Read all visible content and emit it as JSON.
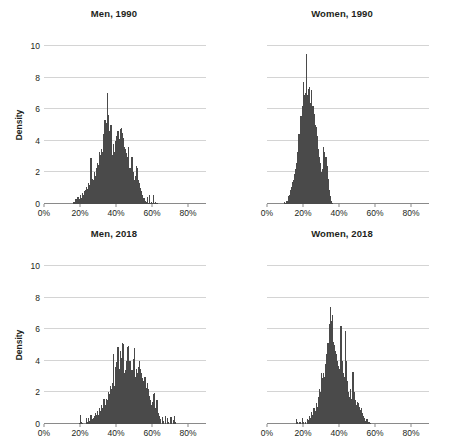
{
  "figure": {
    "cropped_header_text": "",
    "axis_color": "#8a8a8a",
    "grid_color": "#d4d4d4",
    "bar_color": "#4a4a4a",
    "text_color": "#231f20"
  },
  "chart_data": [
    {
      "type": "bar",
      "title": "Men, 1990",
      "xlabel": "",
      "ylabel": "Density",
      "xlim": [
        0,
        90
      ],
      "ylim": [
        0,
        10
      ],
      "xticks": [
        0,
        20,
        40,
        60,
        80
      ],
      "xtick_labels": [
        "0%",
        "20%",
        "40%",
        "60%",
        "80%"
      ],
      "yticks": [
        0,
        2,
        4,
        6,
        8,
        10
      ],
      "ytick_labels": [
        "0",
        "2",
        "4",
        "6",
        "8",
        "10"
      ],
      "grid": "horizontal",
      "legend": "none",
      "bin_width": 0.6,
      "x": [
        16.2,
        16.8,
        17.4,
        18.0,
        18.6,
        19.2,
        19.8,
        20.4,
        21.0,
        21.6,
        22.2,
        22.8,
        23.4,
        24.0,
        24.6,
        25.2,
        25.8,
        26.4,
        27.0,
        27.6,
        28.2,
        28.8,
        29.4,
        30.0,
        30.6,
        31.2,
        31.8,
        32.4,
        33.0,
        33.6,
        34.2,
        34.8,
        35.4,
        36.0,
        36.6,
        37.2,
        37.8,
        38.4,
        39.0,
        39.6,
        40.2,
        40.8,
        41.4,
        42.0,
        42.6,
        43.2,
        43.8,
        44.4,
        45.0,
        45.6,
        46.2,
        46.8,
        47.4,
        48.0,
        48.6,
        49.2,
        49.8,
        50.4,
        51.0,
        51.6,
        52.2,
        52.8,
        53.4,
        54.0,
        54.6,
        55.2,
        55.8,
        56.4,
        57.0,
        57.6,
        58.2,
        58.8,
        59.4,
        60.0,
        60.6,
        61.2,
        61.8,
        62.4
      ],
      "values": [
        0.15,
        0.1,
        0.3,
        0.2,
        0.45,
        0.3,
        0.6,
        0.4,
        0.7,
        0.55,
        0.8,
        0.9,
        1.1,
        0.95,
        1.35,
        1.2,
        2.9,
        1.6,
        1.5,
        2.0,
        1.8,
        2.3,
        2.6,
        2.5,
        3.3,
        3.1,
        3.5,
        3.3,
        4.4,
        5.3,
        5.1,
        7.0,
        5.65,
        4.6,
        5.0,
        5.0,
        3.1,
        3.8,
        3.3,
        4.0,
        4.3,
        4.6,
        4.1,
        4.75,
        4.8,
        4.5,
        4.2,
        3.6,
        3.5,
        3.2,
        3.0,
        3.6,
        2.3,
        2.05,
        3.0,
        2.05,
        1.55,
        1.75,
        2.4,
        2.3,
        1.5,
        1.3,
        1.0,
        0.8,
        0.6,
        0.35,
        0.2,
        0.1,
        0.45,
        0.05,
        0.6,
        0.05,
        0.15,
        0.05,
        0.55,
        0.05,
        0.1,
        0.05
      ]
    },
    {
      "type": "bar",
      "title": "Women, 1990",
      "xlabel": "",
      "ylabel": "",
      "xlim": [
        0,
        90
      ],
      "ylim": [
        0,
        10
      ],
      "xticks": [
        0,
        20,
        40,
        60,
        80
      ],
      "xtick_labels": [
        "0%",
        "20%",
        "40%",
        "60%",
        "80%"
      ],
      "yticks": [
        0,
        2,
        4,
        6,
        8,
        10
      ],
      "ytick_labels": [
        "",
        "",
        "",
        "",
        "",
        ""
      ],
      "grid": "horizontal",
      "legend": "none",
      "bin_width": 0.6,
      "x": [
        9.6,
        10.2,
        10.8,
        11.4,
        12.0,
        12.6,
        13.2,
        13.8,
        14.4,
        15.0,
        15.6,
        16.2,
        16.8,
        17.4,
        18.0,
        18.6,
        19.2,
        19.8,
        20.4,
        21.0,
        21.6,
        22.2,
        22.8,
        23.4,
        24.0,
        24.6,
        25.2,
        25.8,
        26.4,
        27.0,
        27.6,
        28.2,
        28.8,
        29.4,
        30.0,
        30.6,
        31.2,
        31.8,
        32.4,
        33.0,
        33.6,
        34.2,
        34.8,
        35.4,
        36.0
      ],
      "values": [
        0.15,
        0.05,
        0.2,
        0.5,
        0.6,
        0.9,
        1.1,
        1.4,
        1.5,
        1.9,
        2.2,
        2.6,
        3.3,
        4.4,
        4.2,
        5.6,
        6.2,
        7.7,
        6.9,
        7.0,
        9.5,
        6.9,
        7.3,
        7.4,
        6.4,
        7.2,
        6.2,
        5.7,
        5.0,
        4.9,
        4.3,
        3.5,
        3.0,
        2.6,
        2.0,
        2.2,
        3.6,
        3.3,
        3.0,
        2.4,
        1.6,
        0.9,
        0.5,
        0.2,
        0.05
      ]
    },
    {
      "type": "bar",
      "title": "Men, 2018",
      "xlabel": "",
      "ylabel": "Density",
      "xlim": [
        0,
        90
      ],
      "ylim": [
        0,
        10
      ],
      "xticks": [
        0,
        20,
        40,
        60,
        80
      ],
      "xtick_labels": [
        "0%",
        "20%",
        "40%",
        "60%",
        "80%"
      ],
      "yticks": [
        0,
        2,
        4,
        6,
        8,
        10
      ],
      "ytick_labels": [
        "0",
        "2",
        "4",
        "6",
        "8",
        "10"
      ],
      "grid": "horizontal",
      "legend": "none",
      "bin_width": 0.6,
      "x": [
        19.2,
        19.8,
        20.4,
        21.0,
        23.4,
        24.0,
        24.6,
        25.2,
        25.8,
        26.4,
        27.0,
        27.6,
        28.2,
        28.8,
        29.4,
        30.0,
        30.6,
        31.2,
        31.8,
        32.4,
        33.0,
        33.6,
        34.2,
        34.8,
        35.4,
        36.0,
        36.6,
        37.2,
        37.8,
        38.4,
        39.0,
        39.6,
        40.2,
        40.8,
        41.4,
        42.0,
        42.6,
        43.2,
        43.8,
        44.4,
        45.0,
        45.6,
        46.2,
        46.8,
        47.4,
        48.0,
        48.6,
        49.2,
        49.8,
        50.4,
        51.0,
        51.6,
        52.2,
        52.8,
        53.4,
        54.0,
        54.6,
        55.2,
        55.8,
        56.4,
        57.0,
        57.6,
        58.2,
        58.8,
        59.4,
        60.0,
        60.6,
        61.2,
        61.8,
        62.4,
        63.0,
        63.6,
        64.2,
        65.4,
        66.0,
        67.2,
        68.4,
        69.0,
        70.2,
        71.4,
        72.0,
        72.6
      ],
      "values": [
        0.05,
        0.55,
        0.1,
        0.05,
        0.35,
        0.15,
        0.4,
        0.2,
        0.55,
        0.3,
        0.35,
        0.5,
        0.7,
        0.55,
        0.8,
        0.6,
        1.0,
        0.8,
        1.2,
        1.0,
        1.6,
        1.2,
        1.6,
        1.5,
        2.0,
        1.9,
        2.4,
        2.2,
        2.6,
        4.45,
        2.4,
        3.6,
        3.9,
        4.9,
        3.5,
        4.6,
        4.2,
        5.1,
        5.05,
        3.2,
        3.4,
        4.0,
        4.9,
        4.95,
        4.0,
        3.0,
        3.4,
        4.1,
        4.8,
        3.0,
        3.5,
        3.2,
        3.6,
        4.0,
        3.5,
        3.2,
        2.9,
        2.7,
        3.0,
        2.3,
        2.6,
        2.2,
        1.8,
        1.5,
        1.2,
        1.4,
        1.9,
        1.95,
        1.0,
        1.5,
        0.7,
        0.5,
        0.3,
        0.45,
        0.2,
        0.5,
        0.35,
        0.15,
        0.45,
        0.25,
        0.5,
        0.1
      ]
    },
    {
      "type": "bar",
      "title": "Women, 2018",
      "xlabel": "",
      "ylabel": "",
      "xlim": [
        0,
        90
      ],
      "ylim": [
        0,
        10
      ],
      "xticks": [
        0,
        20,
        40,
        60,
        80
      ],
      "xtick_labels": [
        "0%",
        "20%",
        "40%",
        "60%",
        "80%"
      ],
      "yticks": [
        0,
        2,
        4,
        6,
        8,
        10
      ],
      "ytick_labels": [
        "",
        "",
        "",
        "",
        "",
        ""
      ],
      "grid": "horizontal",
      "legend": "none",
      "bin_width": 0.6,
      "x": [
        16.2,
        16.8,
        18.0,
        19.2,
        19.8,
        21.0,
        22.2,
        22.8,
        23.4,
        24.0,
        24.6,
        25.2,
        25.8,
        26.4,
        27.0,
        27.6,
        28.2,
        28.8,
        29.4,
        30.0,
        30.6,
        31.2,
        31.8,
        32.4,
        33.0,
        33.6,
        34.2,
        34.8,
        35.4,
        36.0,
        36.6,
        37.2,
        37.8,
        38.4,
        39.0,
        39.6,
        40.2,
        40.8,
        41.4,
        42.0,
        42.6,
        43.2,
        43.8,
        44.4,
        45.0,
        45.6,
        46.2,
        46.8,
        47.4,
        48.0,
        48.6,
        49.2,
        49.8,
        50.4,
        51.0,
        51.6,
        52.2,
        52.8,
        53.4,
        54.0,
        54.6,
        55.2,
        55.8,
        56.4,
        57.0
      ],
      "values": [
        0.3,
        0.15,
        0.1,
        0.35,
        0.15,
        0.1,
        0.3,
        0.25,
        0.5,
        0.4,
        0.75,
        0.6,
        1.0,
        0.85,
        1.3,
        1.1,
        1.7,
        2.2,
        2.0,
        3.2,
        2.9,
        3.2,
        3.0,
        3.8,
        4.4,
        5.1,
        6.3,
        7.4,
        6.5,
        6.9,
        5.2,
        5.0,
        4.6,
        4.4,
        4.0,
        3.7,
        3.5,
        6.2,
        4.0,
        3.2,
        3.0,
        5.9,
        4.0,
        2.7,
        2.0,
        1.7,
        2.2,
        1.6,
        3.3,
        2.0,
        1.5,
        1.2,
        1.4,
        1.3,
        1.1,
        0.9,
        1.0,
        0.7,
        0.5,
        0.35,
        0.2,
        0.3,
        0.1,
        0.15,
        0.05
      ]
    }
  ]
}
